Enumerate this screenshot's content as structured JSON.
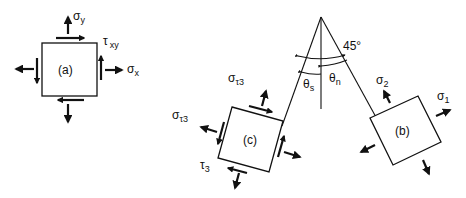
{
  "figure": {
    "element_a": {
      "label": "(a)",
      "sigma_y": {
        "symbol": "σ",
        "sub": "y"
      },
      "sigma_x": {
        "symbol": "σ",
        "sub": "x"
      },
      "tau_xy": {
        "symbol": "τ",
        "sub": "xy"
      }
    },
    "element_b": {
      "label": "(b)",
      "sigma_1": {
        "symbol": "σ",
        "sub": "1"
      },
      "sigma_2": {
        "symbol": "σ",
        "sub": "2"
      }
    },
    "element_c": {
      "label": "(c)",
      "sigma_tau3_top": {
        "symbol": "σ",
        "sub": "τ3"
      },
      "sigma_tau3_left": {
        "symbol": "σ",
        "sub": "τ3"
      },
      "tau_3": {
        "symbol": "τ",
        "sub": "3"
      }
    },
    "angles": {
      "angle_45": "45°",
      "theta_s": {
        "symbol": "θ",
        "sub": "s"
      },
      "theta_n": {
        "symbol": "θ",
        "sub": "n"
      }
    }
  }
}
